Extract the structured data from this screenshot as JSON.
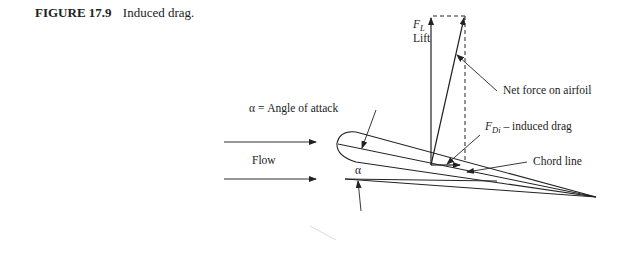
{
  "caption": {
    "number": "FIGURE 17.9",
    "title": "Induced drag."
  },
  "labels": {
    "lift_symbol": "F",
    "lift_subscript": "L",
    "lift_text": "Lift",
    "net_force": "Net force on airfoil",
    "angle_of_attack": "α = Angle of attack",
    "flow": "Flow",
    "alpha": "α",
    "induced_drag_symbol": "F",
    "induced_drag_subscript": "Di",
    "induced_drag_text": " – induced drag",
    "chord_line": "Chord line"
  },
  "colors": {
    "line": "#222222",
    "background": "#ffffff"
  }
}
